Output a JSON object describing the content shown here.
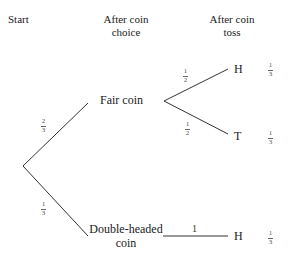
{
  "headers": {
    "start": "Start",
    "coin_choice_line1": "After coin",
    "coin_choice_line2": "choice",
    "coin_toss_line1": "After coin",
    "coin_toss_line2": "toss"
  },
  "nodes": {
    "fair_coin": "Fair coin",
    "double_headed_line1": "Double-headed",
    "double_headed_line2": "coin"
  },
  "branches": {
    "start_to_fair": {
      "num": "2",
      "den": "3"
    },
    "start_to_double": {
      "num": "1",
      "den": "3"
    },
    "fair_to_h": {
      "num": "1",
      "den": "2"
    },
    "fair_to_t": {
      "num": "1",
      "den": "2"
    },
    "double_to_h": "1"
  },
  "outcomes": [
    {
      "label": "H",
      "prob": {
        "num": "1",
        "den": "3"
      }
    },
    {
      "label": "T",
      "prob": {
        "num": "1",
        "den": "3"
      }
    },
    {
      "label": "H",
      "prob": {
        "num": "1",
        "den": "3"
      }
    }
  ]
}
